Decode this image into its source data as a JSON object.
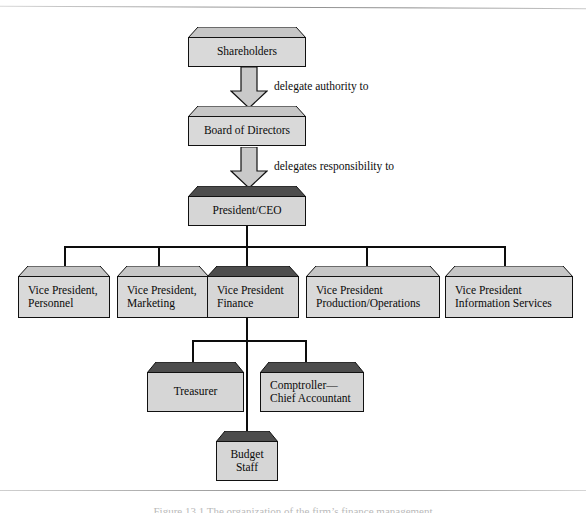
{
  "diagram": {
    "colors": {
      "box_face": "#d9d9d9",
      "box_top_light": "#c6c6c6",
      "box_top_dark": "#4d4d4d",
      "outline": "#111111",
      "arrow_fill": "#c9c9c9",
      "connector": "#0d0d0d"
    },
    "nodes": [
      {
        "id": "shareholders",
        "lines": [
          "Shareholders"
        ],
        "top": "light",
        "align": "center"
      },
      {
        "id": "board",
        "lines": [
          "Board of Directors"
        ],
        "top": "light",
        "align": "center"
      },
      {
        "id": "ceo",
        "lines": [
          "President/CEO"
        ],
        "top": "dark",
        "align": "center"
      },
      {
        "id": "vp-personnel",
        "lines": [
          "Vice President,",
          "Personnel"
        ],
        "top": "light",
        "align": "left"
      },
      {
        "id": "vp-marketing",
        "lines": [
          "Vice President,",
          "Marketing"
        ],
        "top": "light",
        "align": "left"
      },
      {
        "id": "vp-finance",
        "lines": [
          "Vice President",
          "Finance"
        ],
        "top": "dark",
        "align": "left"
      },
      {
        "id": "vp-production",
        "lines": [
          "Vice President",
          "Production/Operations"
        ],
        "top": "light",
        "align": "left"
      },
      {
        "id": "vp-infoserv",
        "lines": [
          "Vice President",
          "Information Services"
        ],
        "top": "light",
        "align": "left"
      },
      {
        "id": "treasurer",
        "lines": [
          "Treasurer"
        ],
        "top": "dark",
        "align": "center"
      },
      {
        "id": "comptroller",
        "lines": [
          "Comptroller—",
          "Chief Accountant"
        ],
        "top": "dark",
        "align": "left"
      },
      {
        "id": "budget-staff",
        "lines": [
          "Budget",
          "Staff"
        ],
        "top": "dark",
        "align": "center"
      }
    ],
    "arrow_labels": {
      "shareholders_to_board": "delegate authority to",
      "board_to_ceo": "delegates  responsibility to"
    },
    "caption": "Figure 13.1   The organization of the firm’s finance management"
  }
}
